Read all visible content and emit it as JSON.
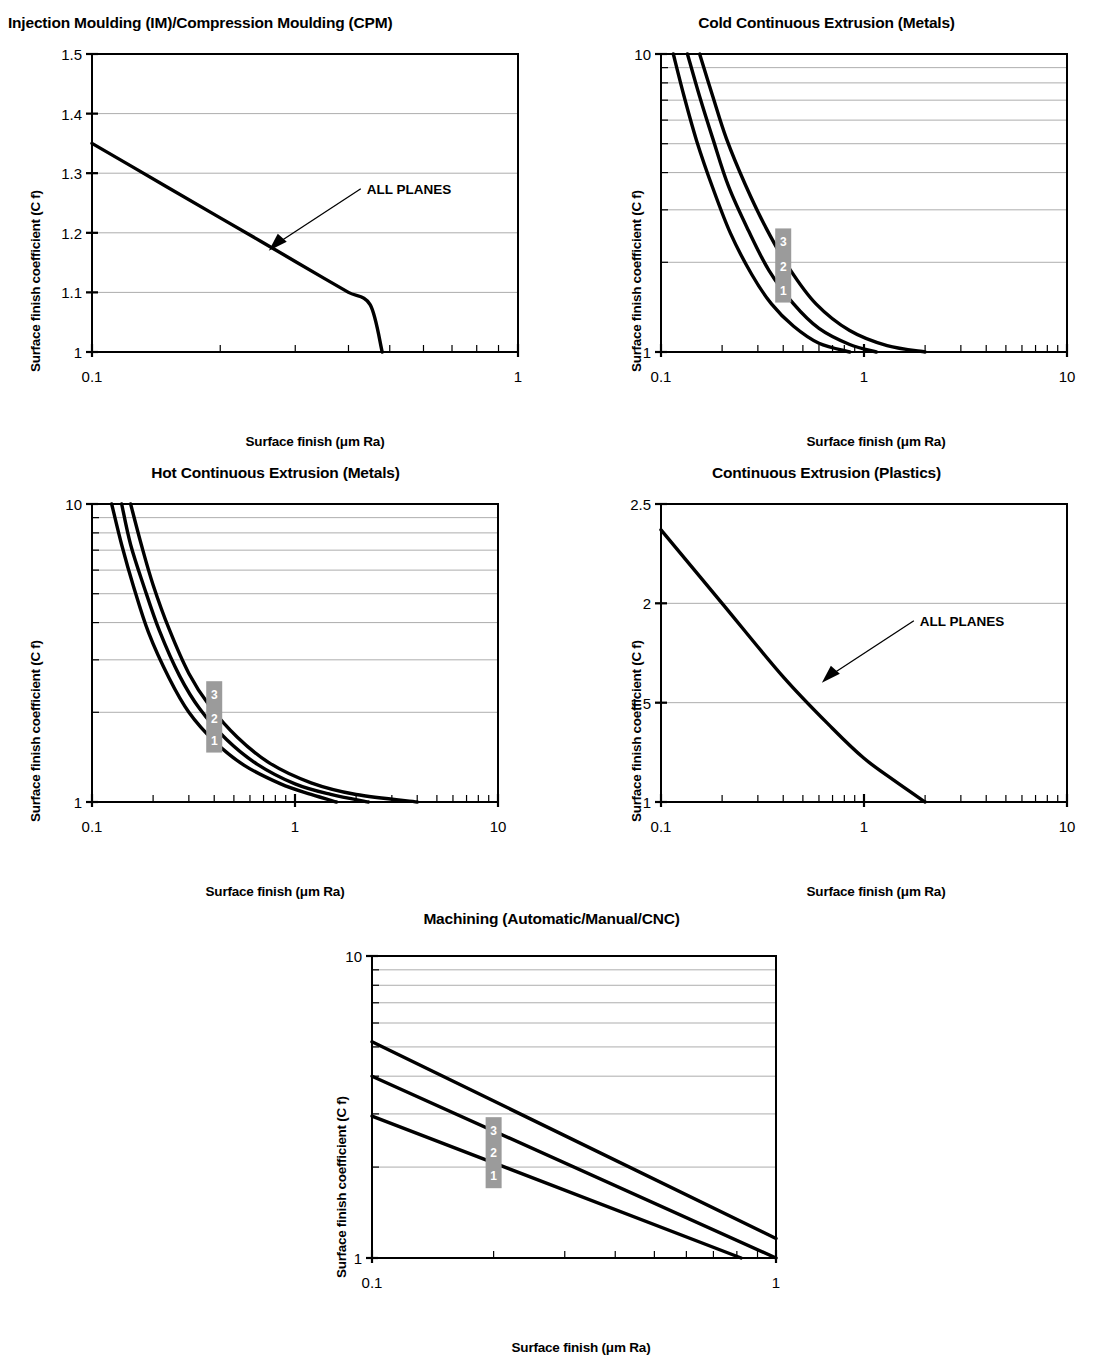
{
  "common": {
    "xlabel": "Surface finish (μm Ra)",
    "ylabel": "Surface finish coefficient (C f)",
    "annotation": "ALL PLANES",
    "series_labels": [
      "1",
      "2",
      "3"
    ],
    "badge_color": "#9b9b9b",
    "line_color": "#000000",
    "grid_color": "#8a8a8a"
  },
  "chart_data": [
    {
      "id": "injection-moulding",
      "type": "line",
      "title": "Injection Moulding (IM)/Compression Moulding (CPM)",
      "xlabel": "Surface finish (μm Ra)",
      "ylabel": "Surface finish coefficient (C f)",
      "xscale": "log",
      "yscale": "linear",
      "xlim": [
        0.1,
        1
      ],
      "ylim": [
        1,
        1.5
      ],
      "xticks": [
        "0.1",
        "1"
      ],
      "yticks": [
        "1",
        "1.1",
        "1.2",
        "1.3",
        "1.4",
        "1.5"
      ],
      "grid": true,
      "annotations": [
        {
          "text": "ALL PLANES",
          "points_to": [
            0.26,
            1.17
          ]
        }
      ],
      "series": [
        {
          "name": "ALL PLANES",
          "x": [
            0.1,
            0.15,
            0.2,
            0.25,
            0.3,
            0.35,
            0.4,
            0.45,
            0.48
          ],
          "y": [
            1.35,
            1.277,
            1.225,
            1.185,
            1.152,
            1.124,
            1.1,
            1.079,
            1.0
          ]
        }
      ]
    },
    {
      "id": "cold-continuous-extrusion-metals",
      "type": "line",
      "title": "Cold Continuous Extrusion (Metals)",
      "xlabel": "Surface finish (μm Ra)",
      "ylabel": "Surface finish coefficient (C f)",
      "xscale": "log",
      "yscale": "log",
      "xlim": [
        0.1,
        10
      ],
      "ylim": [
        1,
        10
      ],
      "xticks": [
        "0.1",
        "1",
        "10"
      ],
      "yticks": [
        "1",
        "10"
      ],
      "grid": true,
      "series": [
        {
          "name": "1",
          "x": [
            0.115,
            0.13,
            0.15,
            0.18,
            0.22,
            0.28,
            0.35,
            0.45,
            0.6,
            0.85
          ],
          "y": [
            10,
            7.2,
            5.1,
            3.55,
            2.5,
            1.82,
            1.45,
            1.22,
            1.07,
            1.0
          ]
        },
        {
          "name": "2",
          "x": [
            0.135,
            0.155,
            0.18,
            0.215,
            0.27,
            0.34,
            0.45,
            0.6,
            0.85,
            1.15
          ],
          "y": [
            10,
            7.2,
            5.2,
            3.6,
            2.55,
            1.88,
            1.45,
            1.2,
            1.06,
            1.0
          ]
        },
        {
          "name": "3",
          "x": [
            0.155,
            0.18,
            0.21,
            0.26,
            0.33,
            0.43,
            0.58,
            0.85,
            1.3,
            2.0
          ],
          "y": [
            10,
            7.2,
            5.2,
            3.65,
            2.6,
            1.9,
            1.45,
            1.18,
            1.05,
            1.0
          ]
        }
      ],
      "badges": [
        {
          "label": "3",
          "x": 0.4,
          "y": 2.35
        },
        {
          "label": "2",
          "x": 0.4,
          "y": 1.95
        },
        {
          "label": "1",
          "x": 0.4,
          "y": 1.62
        }
      ]
    },
    {
      "id": "hot-continuous-extrusion-metals",
      "type": "line",
      "title": "Hot Continuous Extrusion (Metals)",
      "xlabel": "Surface finish (μm Ra)",
      "ylabel": "Surface finish coefficient (C f)",
      "xscale": "log",
      "yscale": "log",
      "xlim": [
        0.1,
        10
      ],
      "ylim": [
        1,
        10
      ],
      "xticks": [
        "0.1",
        "1",
        "10"
      ],
      "yticks": [
        "1",
        "10"
      ],
      "grid": true,
      "series": [
        {
          "name": "1",
          "x": [
            0.125,
            0.14,
            0.16,
            0.19,
            0.24,
            0.3,
            0.4,
            0.56,
            0.85,
            1.2,
            1.6
          ],
          "y": [
            10,
            7.3,
            5.3,
            3.7,
            2.6,
            2.0,
            1.6,
            1.33,
            1.15,
            1.06,
            1.0
          ]
        },
        {
          "name": "2",
          "x": [
            0.14,
            0.155,
            0.18,
            0.215,
            0.27,
            0.34,
            0.46,
            0.65,
            1.0,
            1.5,
            2.3
          ],
          "y": [
            10,
            7.3,
            5.3,
            3.75,
            2.65,
            2.05,
            1.62,
            1.34,
            1.15,
            1.06,
            1.0
          ]
        },
        {
          "name": "3",
          "x": [
            0.155,
            0.175,
            0.2,
            0.24,
            0.3,
            0.38,
            0.52,
            0.75,
            1.2,
            2.0,
            4.0
          ],
          "y": [
            10,
            7.3,
            5.35,
            3.8,
            2.7,
            2.1,
            1.65,
            1.35,
            1.16,
            1.06,
            1.0
          ]
        }
      ],
      "badges": [
        {
          "label": "3",
          "x": 0.4,
          "y": 2.3
        },
        {
          "label": "2",
          "x": 0.4,
          "y": 1.92
        },
        {
          "label": "1",
          "x": 0.4,
          "y": 1.62
        }
      ]
    },
    {
      "id": "continuous-extrusion-plastics",
      "type": "line",
      "title": "Continuous Extrusion (Plastics)",
      "xlabel": "Surface finish (μm Ra)",
      "ylabel": "Surface finish coefficient (C f)",
      "xscale": "log",
      "yscale": "linear",
      "xlim": [
        0.1,
        10
      ],
      "ylim": [
        1,
        2.5
      ],
      "xticks": [
        "0.1",
        "1",
        "10"
      ],
      "yticks": [
        "1",
        "1.5",
        "2",
        "2.5"
      ],
      "grid": true,
      "annotations": [
        {
          "text": "ALL PLANES",
          "points_to": [
            0.62,
            1.6
          ]
        }
      ],
      "series": [
        {
          "name": "ALL PLANES",
          "x": [
            0.1,
            0.2,
            0.4,
            0.7,
            1.0,
            1.4,
            2.0
          ],
          "y": [
            2.37,
            2.0,
            1.63,
            1.37,
            1.22,
            1.11,
            1.0
          ]
        }
      ]
    },
    {
      "id": "machining",
      "type": "line",
      "title": "Machining (Automatic/Manual/CNC)",
      "xlabel": "Surface finish (μm Ra)",
      "ylabel": "Surface finish coefficient (C f)",
      "xscale": "log",
      "yscale": "log",
      "xlim": [
        0.1,
        1
      ],
      "ylim": [
        1,
        10
      ],
      "xticks": [
        "0.1",
        "1"
      ],
      "yticks": [
        "1",
        "10"
      ],
      "grid": true,
      "series": [
        {
          "name": "1",
          "x": [
            0.1,
            0.82
          ],
          "y": [
            2.95,
            1.0
          ]
        },
        {
          "name": "2",
          "x": [
            0.1,
            1.0
          ],
          "y": [
            4.0,
            1.0
          ]
        },
        {
          "name": "3",
          "x": [
            0.1,
            1.0
          ],
          "y": [
            5.2,
            1.16
          ]
        }
      ],
      "badges": [
        {
          "label": "3",
          "x": 0.2,
          "y": 2.65
        },
        {
          "label": "2",
          "x": 0.2,
          "y": 2.25
        },
        {
          "label": "1",
          "x": 0.2,
          "y": 1.88
        }
      ]
    }
  ]
}
